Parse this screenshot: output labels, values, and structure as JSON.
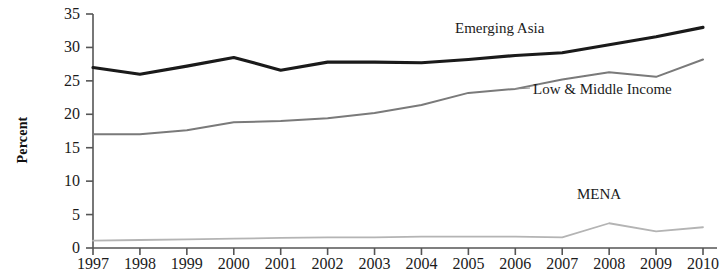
{
  "axis": {
    "ylabel": "Percent",
    "yticks": [
      0,
      5,
      10,
      15,
      20,
      25,
      30,
      35
    ],
    "xticks": [
      "1997",
      "1998",
      "1999",
      "2000",
      "2001",
      "2002",
      "2003",
      "2004",
      "2005",
      "2006",
      "2007",
      "2008",
      "2009",
      "2010"
    ]
  },
  "labels": {
    "emerging_asia": "Emerging Asia",
    "low_middle_income": "Low & Middle Income",
    "mena": "MENA"
  },
  "colors": {
    "emerging_asia": "#1a1a1a",
    "low_middle_income": "#7a7a7a",
    "mena": "#b4b4b4",
    "axis": "#555555",
    "background": "#ffffff"
  },
  "chart_data": {
    "type": "line",
    "title": "",
    "xlabel": "",
    "ylabel": "Percent",
    "grid": false,
    "legend": "inline-annotations",
    "xlim": [
      1997,
      2010
    ],
    "ylim": [
      0,
      35
    ],
    "yticks": [
      0,
      5,
      10,
      15,
      20,
      25,
      30,
      35
    ],
    "categories": [
      "1997",
      "1998",
      "1999",
      "2000",
      "2001",
      "2002",
      "2003",
      "2004",
      "2005",
      "2006",
      "2007",
      "2008",
      "2009",
      "2010"
    ],
    "series": [
      {
        "name": "Emerging Asia",
        "color": "#1a1a1a",
        "values": [
          27.0,
          26.0,
          27.2,
          28.5,
          26.6,
          27.8,
          27.8,
          27.7,
          28.2,
          28.8,
          29.2,
          30.4,
          31.6,
          33.0
        ]
      },
      {
        "name": "Low & Middle Income",
        "color": "#7a7a7a",
        "values": [
          17.0,
          17.0,
          17.6,
          18.8,
          19.0,
          19.4,
          20.2,
          21.4,
          23.2,
          23.8,
          25.2,
          26.3,
          25.6,
          28.2
        ]
      },
      {
        "name": "MENA",
        "color": "#b4b4b4",
        "values": [
          1.1,
          1.2,
          1.3,
          1.4,
          1.5,
          1.6,
          1.6,
          1.7,
          1.7,
          1.7,
          1.6,
          3.7,
          2.5,
          3.1
        ]
      }
    ]
  }
}
